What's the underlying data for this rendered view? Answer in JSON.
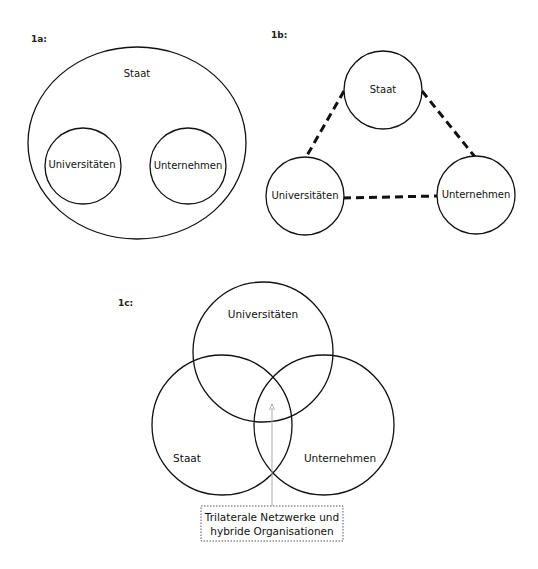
{
  "figures": {
    "fig1a": {
      "tag": "1a:",
      "outer": "Staat",
      "inner_left": "Universitäten",
      "inner_right": "Unternehmen"
    },
    "fig1b": {
      "tag": "1b:",
      "top": "Staat",
      "left": "Universitäten",
      "right": "Unternehmen"
    },
    "fig1c": {
      "tag": "1c:",
      "top": "Universitäten",
      "left": "Staat",
      "right": "Unternehmen",
      "callout_line1": "Trilaterale Netzwerke und",
      "callout_line2": "hybride Organisationen"
    }
  },
  "colors": {
    "stroke": "#111111",
    "callout_line": "#aaaaaa"
  }
}
